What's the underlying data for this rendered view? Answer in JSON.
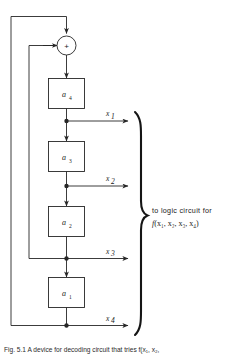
{
  "figure": {
    "type": "block-diagram",
    "adder": {
      "symbol": "+",
      "name": "modulo-2-adder"
    },
    "registers": [
      {
        "id": "a4",
        "label": "a",
        "subscript": "4"
      },
      {
        "id": "a3",
        "label": "a",
        "subscript": "3"
      },
      {
        "id": "a2",
        "label": "a",
        "subscript": "2"
      },
      {
        "id": "a1",
        "label": "a",
        "subscript": "1"
      }
    ],
    "taps": [
      {
        "id": "x1",
        "label": "x",
        "subscript": "1"
      },
      {
        "id": "x2",
        "label": "x",
        "subscript": "2"
      },
      {
        "id": "x3",
        "label": "x",
        "subscript": "3"
      },
      {
        "id": "x4",
        "label": "x",
        "subscript": "4"
      }
    ],
    "annotation": {
      "line1": "to logic circuit for",
      "function_name": "f",
      "function_args": "(x₁, x₂, x₃, x₄)"
    },
    "caption": "Fig. 5.1  A device for decoding circuit that tries f(x₁, x₂,",
    "colors": {
      "line": "#262626",
      "text": "#1a1a1a",
      "background": "#ffffff"
    }
  }
}
